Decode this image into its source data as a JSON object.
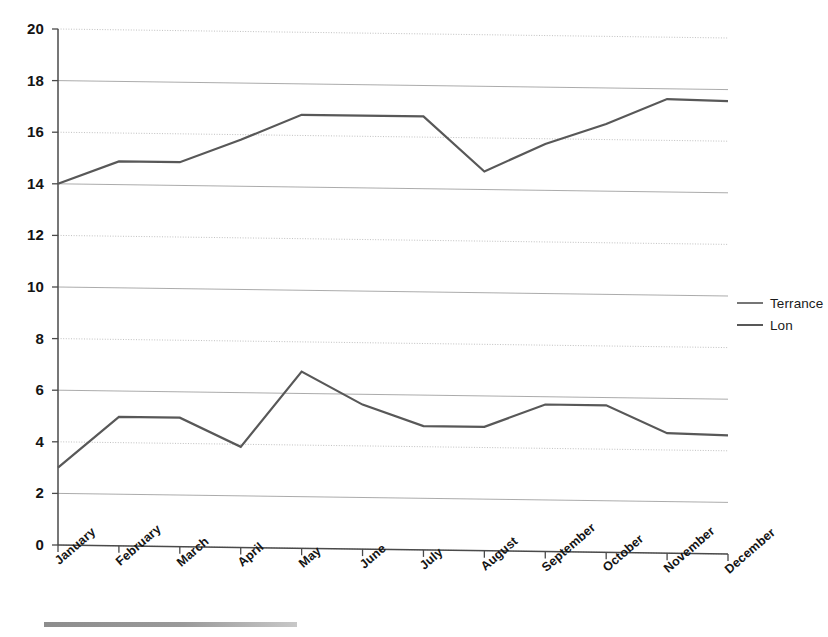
{
  "chart_data": {
    "type": "line",
    "title": "",
    "xlabel": "",
    "ylabel": "",
    "ylim": [
      0,
      20
    ],
    "ytick_step": 2,
    "grid": true,
    "legend_position": "right",
    "categories": [
      "January",
      "February",
      "March",
      "April",
      "May",
      "June",
      "July",
      "August",
      "September",
      "October",
      "November",
      "December"
    ],
    "yticks": [
      "0",
      "2",
      "4",
      "6",
      "8",
      "10",
      "12",
      "14",
      "16",
      "18",
      "20"
    ],
    "series": [
      {
        "name": "Terrance",
        "color": "#585858",
        "values": [
          14.0,
          14.9,
          14.9,
          15.8,
          16.8,
          16.8,
          16.8,
          14.7,
          15.8,
          16.6,
          17.6,
          17.55
        ]
      },
      {
        "name": "Lon",
        "color": "#585858",
        "values": [
          3.0,
          5.0,
          5.0,
          3.9,
          6.85,
          5.6,
          4.8,
          4.8,
          5.7,
          5.7,
          4.65,
          4.6
        ]
      }
    ]
  },
  "legend": {
    "entries": [
      {
        "label": "Terrance",
        "swatch": "line-swatch-dashed"
      },
      {
        "label": "Lon",
        "swatch": "line-swatch-solid"
      }
    ]
  }
}
